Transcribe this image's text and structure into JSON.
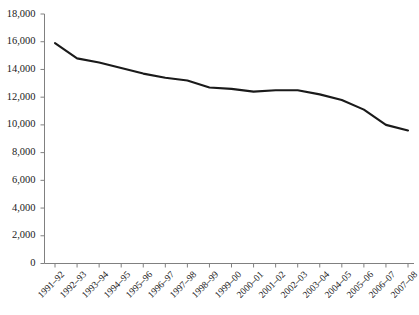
{
  "chart_data": {
    "type": "line",
    "title": "",
    "subtitle": "",
    "xlabel": "",
    "ylabel": "",
    "categories": [
      "1991–92",
      "1992–93",
      "1993–94",
      "1994–95",
      "1995–96",
      "1996–97",
      "1997–98",
      "1998–99",
      "1999–00",
      "2000–01",
      "2001–02",
      "2002–03",
      "2003–04",
      "2004–05",
      "2005–06",
      "2006–07",
      "2007–08"
    ],
    "values": [
      15900,
      14800,
      14500,
      14100,
      13700,
      13400,
      13200,
      12700,
      12600,
      12400,
      12500,
      12500,
      12200,
      11800,
      11100,
      10000,
      9600
    ],
    "series": [
      {
        "name": "series-1",
        "values": [
          15900,
          14800,
          14500,
          14100,
          13700,
          13400,
          13200,
          12700,
          12600,
          12400,
          12500,
          12500,
          12200,
          11800,
          11100,
          10000,
          9600
        ],
        "color": "#1a1a1a"
      }
    ],
    "ylim": [
      0,
      18000
    ],
    "yticks": [
      0,
      2000,
      4000,
      6000,
      8000,
      10000,
      12000,
      14000,
      16000,
      18000
    ],
    "ytick_labels": [
      "0",
      "2,000",
      "4,000",
      "6,000",
      "8,000",
      "10,000",
      "12,000",
      "14,000",
      "16,000",
      "18,000"
    ],
    "grid": false,
    "legend": false,
    "legend_position": "none",
    "line_color": "#1a1a1a",
    "axis_color": "#808080",
    "background_color": "#ffffff",
    "markers": false
  }
}
